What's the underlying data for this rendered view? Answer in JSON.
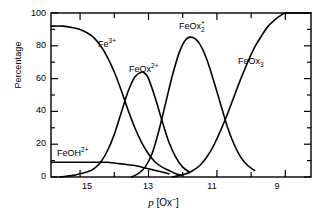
{
  "chart_data": {
    "type": "line",
    "title": "",
    "xlabel": "p [Ox⁻]",
    "ylabel": "Percentage",
    "xlim": [
      15.85,
      8.25
    ],
    "ylim": [
      0,
      100
    ],
    "grid": false,
    "legend": "inline-curve-labels",
    "xticks": [
      15,
      13,
      11,
      9
    ],
    "xtick_labels": [
      "15",
      "13",
      "11",
      "9"
    ],
    "yticks": [
      0,
      20,
      40,
      60,
      80,
      100
    ],
    "ytick_labels": [
      "0",
      "20",
      "40",
      "60",
      "80",
      "100"
    ],
    "x_axis_direction": "decreasing",
    "series": [
      {
        "name": "Fe3+",
        "label_html": "Fe<sup>3+</sup>",
        "label_x": 13.95,
        "label_y": 78,
        "x": [
          15.85,
          15.5,
          15.2,
          15.0,
          14.8,
          14.6,
          14.4,
          14.2,
          14.0,
          13.8,
          13.6,
          13.4,
          13.2,
          13.0,
          12.8,
          12.6,
          12.4,
          12.2,
          12.0
        ],
        "y": [
          92,
          92,
          91,
          90,
          88,
          85,
          80,
          73,
          64,
          53,
          41,
          30,
          21,
          14,
          9,
          6,
          4,
          2,
          1
        ]
      },
      {
        "name": "FeOH2+",
        "label_html": "FeOH<sup>2+</sup>",
        "label_x": 15.15,
        "label_y": 14,
        "x": [
          15.85,
          15.5,
          15.2,
          15.0,
          14.8,
          14.6,
          14.4,
          14.2,
          14.0,
          13.8,
          13.6,
          13.4,
          13.2,
          13.0,
          12.8,
          12.6,
          12.4
        ],
        "y": [
          9,
          9,
          9,
          9,
          9,
          9,
          9,
          9,
          8.5,
          8,
          7.5,
          7,
          6,
          5,
          4,
          3,
          2
        ]
      },
      {
        "name": "FeOx2+",
        "label_html": "FeOx<sup>2+</sup>",
        "label_x": 13.72,
        "label_y": 70,
        "x": [
          15.6,
          15.2,
          15.0,
          14.8,
          14.6,
          14.4,
          14.2,
          14.0,
          13.8,
          13.6,
          13.4,
          13.2,
          13.1,
          13.0,
          12.8,
          12.6,
          12.4,
          12.2,
          12.0,
          11.8
        ],
        "y": [
          0,
          1,
          2,
          3,
          5,
          9,
          16,
          26,
          39,
          52,
          61,
          64,
          63,
          60,
          48,
          34,
          21,
          12,
          6,
          3
        ]
      },
      {
        "name": "FeOx2+ (FeOx subscript2 plus)",
        "label_html": "FeOx<sub>2</sub><sup>+</sup>",
        "label_x": 12.35,
        "label_y": 93,
        "x": [
          13.5,
          13.3,
          13.1,
          12.9,
          12.7,
          12.5,
          12.3,
          12.1,
          11.9,
          11.7,
          11.5,
          11.3,
          11.1,
          10.9,
          10.7,
          10.5,
          10.3,
          10.1,
          9.9
        ],
        "y": [
          0,
          2,
          6,
          14,
          28,
          45,
          62,
          76,
          84,
          85,
          81,
          72,
          59,
          45,
          31,
          20,
          12,
          7,
          4
        ]
      },
      {
        "name": "FeOx3",
        "label_html": "FeOx<sub>3</sub>",
        "label_x": 10.55,
        "label_y": 71,
        "x": [
          12.3,
          12.1,
          11.9,
          11.7,
          11.5,
          11.3,
          11.1,
          10.9,
          10.7,
          10.5,
          10.3,
          10.1,
          9.9,
          9.7,
          9.5,
          9.3,
          9.1,
          9.0,
          8.8,
          8.5,
          8.25
        ],
        "y": [
          0,
          1,
          2,
          4,
          7,
          12,
          19,
          28,
          38,
          49,
          60,
          70,
          79,
          86,
          92,
          96,
          99,
          100,
          100,
          100,
          100
        ]
      }
    ]
  },
  "axes": {
    "ylabel": "Percentage",
    "xlabel_italic": "p",
    "xlabel_bracket_open": "[",
    "xlabel_ox": "Ox",
    "xlabel_charge": "−",
    "xlabel_bracket_close": "]",
    "ytick_100": "100",
    "ytick_80": "80",
    "ytick_60": "60",
    "ytick_40": "40",
    "ytick_20": "20",
    "ytick_0": "0",
    "xtick_15": "15",
    "xtick_13": "13",
    "xtick_11": "11",
    "xtick_9": "9"
  },
  "curve_labels": {
    "fe3": {
      "base": "Fe",
      "sup": "3+"
    },
    "feoh2": {
      "base": "FeOH",
      "sup": "2+"
    },
    "feox2plus": {
      "base": "FeOx",
      "sup": "2+"
    },
    "feox2sub": {
      "base": "FeOx",
      "sub": "2",
      "sup": "+"
    },
    "feox3": {
      "base": "FeOx",
      "sub": "3"
    }
  },
  "colors": {
    "line": "#000000",
    "axis": "#000000",
    "background": "#ffffff"
  }
}
